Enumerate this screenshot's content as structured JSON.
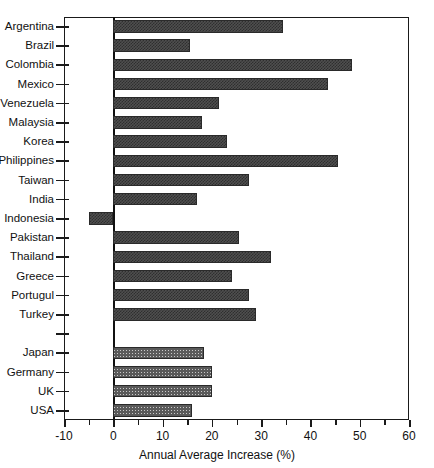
{
  "chart_data": {
    "type": "bar",
    "orientation": "horizontal",
    "title": "",
    "xlabel": "Annual Average Increase (%)",
    "ylabel": "",
    "xlim": [
      -10,
      60
    ],
    "xticks": [
      -10,
      0,
      10,
      20,
      30,
      40,
      50,
      60
    ],
    "xtick_labels": [
      "-10",
      "0",
      "10",
      "20",
      "30",
      "40",
      "50",
      "60"
    ],
    "minor_tick_step": 5,
    "grid": false,
    "legend": "none",
    "zero_reference_line": 0,
    "categories": [
      "Argentina",
      "Brazil",
      "Colombia",
      "Mexico",
      "Venezuela",
      "Malaysia",
      "Korea",
      "Philippines",
      "Taiwan",
      "India",
      "Indonesia",
      "Pakistan",
      "Thailand",
      "Greece",
      "Portugul",
      "Turkey",
      "",
      "Japan",
      "Germany",
      "UK",
      "USA"
    ],
    "values": [
      34.5,
      15.5,
      48.5,
      43.5,
      21.5,
      18.0,
      23.0,
      45.5,
      27.5,
      17.0,
      -5.0,
      25.5,
      32.0,
      24.0,
      27.5,
      29.0,
      null,
      18.5,
      20.0,
      20.0,
      16.0
    ],
    "series": [
      {
        "name": "Emerging markets",
        "style": "dark-hatch",
        "color": "#4f4f4f",
        "points": [
          {
            "category": "Argentina",
            "value": 34.5
          },
          {
            "category": "Brazil",
            "value": 15.5
          },
          {
            "category": "Colombia",
            "value": 48.5
          },
          {
            "category": "Mexico",
            "value": 43.5
          },
          {
            "category": "Venezuela",
            "value": 21.5
          },
          {
            "category": "Malaysia",
            "value": 18.0
          },
          {
            "category": "Korea",
            "value": 23.0
          },
          {
            "category": "Philippines",
            "value": 45.5
          },
          {
            "category": "Taiwan",
            "value": 27.5
          },
          {
            "category": "India",
            "value": 17.0
          },
          {
            "category": "Indonesia",
            "value": -5.0
          },
          {
            "category": "Pakistan",
            "value": 25.5
          },
          {
            "category": "Thailand",
            "value": 32.0
          },
          {
            "category": "Greece",
            "value": 24.0
          },
          {
            "category": "Portugul",
            "value": 27.5
          },
          {
            "category": "Turkey",
            "value": 29.0
          }
        ]
      },
      {
        "name": "Developed markets",
        "style": "light-grid",
        "color": "#c9c9c9",
        "points": [
          {
            "category": "Japan",
            "value": 18.5
          },
          {
            "category": "Germany",
            "value": 20.0
          },
          {
            "category": "UK",
            "value": 20.0
          },
          {
            "category": "USA",
            "value": 16.0
          }
        ]
      }
    ]
  },
  "axis": {
    "x_title": "Annual Average Increase (%)"
  }
}
